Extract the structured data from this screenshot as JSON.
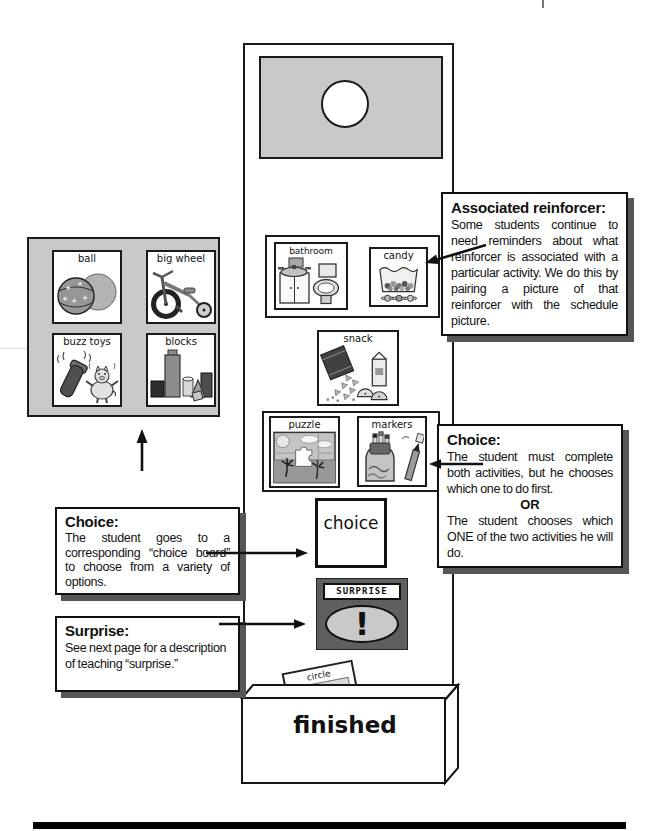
{
  "colors": {
    "board_gray": "#c9c9c9",
    "surprise_card_bg": "#5f5f5f",
    "callout_shadow": "#565656",
    "footer_bar": "#000000"
  },
  "choice_board": {
    "cards": [
      {
        "label": "ball"
      },
      {
        "label": "big wheel"
      },
      {
        "label": "buzz toys"
      },
      {
        "label": "blocks"
      }
    ]
  },
  "schedule": {
    "cards": {
      "bathroom": {
        "label": "bathroom"
      },
      "candy": {
        "label": "candy"
      },
      "snack": {
        "label": "snack"
      },
      "puzzle": {
        "label": "puzzle"
      },
      "markers": {
        "label": "markers"
      },
      "choice": {
        "label": "choice"
      },
      "surprise": {
        "label": "SURPRISE",
        "mark": "!"
      },
      "circle": {
        "label": "circle"
      },
      "finished": {
        "label": "finished"
      }
    }
  },
  "callouts": {
    "associated_reinforcer": {
      "title": "Associated reinforcer:",
      "body": "Some students continue to need reminders about what reinforcer is associated with a particular activity.  We do this by pairing a picture of that reinforcer with the schedule picture."
    },
    "choice_right": {
      "title": "Choice:",
      "body_top": "The student must complete both activities, but he chooses which one to do first.",
      "or": "OR",
      "body_bottom": "The student chooses which ONE of the two activities he will do."
    },
    "choice_left": {
      "title": "Choice:",
      "body": "The student goes to a corresponding “choice board” to choose from a variety of options."
    },
    "surprise": {
      "title": "Surprise:",
      "body": "See next page for a description of teaching “surprise.”"
    }
  },
  "icons": {
    "ball": "two-balls-icon",
    "big_wheel": "tricycle-icon",
    "buzz_toys": "vibrating-flashlight-and-pig-icon",
    "blocks": "building-blocks-icon",
    "bathroom": "sink-and-toilet-icon",
    "candy": "candy-bag-icon",
    "snack": "chips-milk-apple-icon",
    "puzzle": "puzzle-scene-icon",
    "markers": "marker-pack-icon",
    "surprise": "exclamation-icon",
    "header": "hanging-hole-icon"
  }
}
